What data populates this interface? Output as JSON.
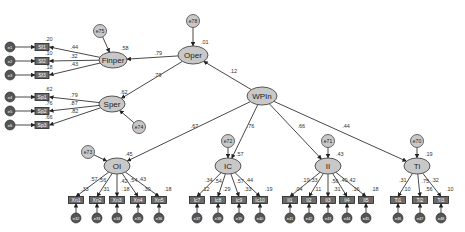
{
  "diagram": {
    "type": "structural-equation-model",
    "latent": [
      {
        "id": "Oper",
        "label": "Oper",
        "x": 193,
        "y": 55,
        "rx": 15,
        "ry": 9,
        "r2": ".01"
      },
      {
        "id": "Finper",
        "label": "Finper",
        "x": 113,
        "y": 60,
        "rx": 14,
        "ry": 8,
        "r2": ".58"
      },
      {
        "id": "Sper",
        "label": "Sper",
        "x": 112,
        "y": 104,
        "rx": 13,
        "ry": 8,
        "r2": ".62"
      },
      {
        "id": "WPIn",
        "label": "WPIn",
        "x": 262,
        "y": 96,
        "rx": 15,
        "ry": 9,
        "r2": ""
      },
      {
        "id": "OI",
        "label": "OI",
        "x": 117,
        "y": 166,
        "rx": 13,
        "ry": 8,
        "r2": ".45"
      },
      {
        "id": "IC",
        "label": "IC",
        "x": 228,
        "y": 166,
        "rx": 13,
        "ry": 8,
        "r2": ".57"
      },
      {
        "id": "II",
        "label": "II",
        "x": 328,
        "y": 166,
        "rx": 13,
        "ry": 8,
        "r2": ".43"
      },
      {
        "id": "Ti",
        "label": "Ti",
        "x": 417,
        "y": 166,
        "rx": 13,
        "ry": 8,
        "r2": ".19"
      }
    ],
    "disturbances": [
      {
        "id": "e78",
        "label": "e78",
        "x": 193,
        "y": 21,
        "target": "Oper"
      },
      {
        "id": "e75",
        "label": "e75",
        "x": 100,
        "y": 31,
        "target": "Finper"
      },
      {
        "id": "e74",
        "label": "e74",
        "x": 139,
        "y": 127,
        "target": "Sper"
      },
      {
        "id": "e73",
        "label": "e73",
        "x": 88,
        "y": 152,
        "target": "OI"
      },
      {
        "id": "e72",
        "label": "e72",
        "x": 228,
        "y": 141,
        "target": "IC"
      },
      {
        "id": "e71",
        "label": "e71",
        "x": 328,
        "y": 141,
        "target": "II"
      },
      {
        "id": "e70",
        "label": "e70",
        "x": 417,
        "y": 141,
        "target": "Ti"
      }
    ],
    "structural_paths": [
      {
        "from": "Oper",
        "to": "Finper",
        "coef": ".79"
      },
      {
        "from": "Oper",
        "to": "Sper",
        "coef": ".79"
      },
      {
        "from": "WPIn",
        "to": "Oper",
        "coef": ".12"
      },
      {
        "from": "WPIn",
        "to": "OI",
        "coef": ".67"
      },
      {
        "from": "WPIn",
        "to": "IC",
        "coef": ".76"
      },
      {
        "from": "WPIn",
        "to": "II",
        "coef": ".66"
      },
      {
        "from": "WPIn",
        "to": "Ti",
        "coef": ".44"
      }
    ],
    "left_indicators": [
      {
        "label": "Sf1",
        "x": 42,
        "y": 47,
        "from": "Finper",
        "loading": ".44",
        "r2": ".20",
        "err": "e1"
      },
      {
        "label": "Sf2",
        "x": 42,
        "y": 61,
        "from": "Finper",
        "loading": ".32",
        "r2": ".10",
        "err": "e2"
      },
      {
        "label": "Sf3",
        "x": 42,
        "y": 75,
        "from": "Finper",
        "loading": ".43",
        "r2": ".18",
        "err": "e3"
      },
      {
        "label": "Sp1",
        "x": 42,
        "y": 97,
        "from": "Sper",
        "loading": ".79",
        "r2": ".62",
        "err": "e4"
      },
      {
        "label": "Sp2",
        "x": 42,
        "y": 111,
        "from": "Sper",
        "loading": ".87",
        "r2": ".76",
        "err": "e5"
      },
      {
        "label": "Sp3",
        "x": 42,
        "y": 125,
        "from": "Sper",
        "loading": ".82",
        "r2": ".66",
        "err": "e6"
      }
    ],
    "bottom_indicators": [
      {
        "label": "Xn1",
        "x": 76,
        "from": "OI",
        "loading": ".57",
        "r2": ".33",
        "err": "e32"
      },
      {
        "label": "Xn2",
        "x": 97,
        "from": "OI",
        "loading": ".56",
        "r2": ".31",
        "err": "e33"
      },
      {
        "label": "Xn3",
        "x": 117,
        "from": "OI",
        "loading": ".42",
        "r2": ".18",
        "err": "e34"
      },
      {
        "label": "Xn4",
        "x": 138,
        "from": "OI",
        "loading": ".54",
        "r2": ".30",
        "err": "e35"
      },
      {
        "label": "Xn5",
        "x": 159,
        "from": "OI",
        "loading": ".43",
        "r2": ".18",
        "err": "e36"
      },
      {
        "label": "Ic7",
        "x": 197,
        "from": "IC",
        "loading": ".34",
        "r2": ".12",
        "err": "e37"
      },
      {
        "label": "Ic8",
        "x": 218,
        "from": "IC",
        "loading": ".54",
        "r2": ".29",
        "err": "e38"
      },
      {
        "label": "Ic9",
        "x": 239,
        "from": "IC",
        "loading": ".57",
        "r2": ".33",
        "err": "e39"
      },
      {
        "label": "Ic10",
        "x": 260,
        "from": "IC",
        "loading": ".44",
        "r2": ".19",
        "err": "e40"
      },
      {
        "label": "Ii1",
        "x": 290,
        "from": "II",
        "loading": ".19",
        "r2": ".04",
        "err": "e41"
      },
      {
        "label": "Ii2",
        "x": 309,
        "from": "II",
        "loading": ".33",
        "r2": ".11",
        "err": "e42"
      },
      {
        "label": "Ii3",
        "x": 328,
        "from": "II",
        "loading": ".56",
        "r2": ".31",
        "err": "e43"
      },
      {
        "label": "Ii4",
        "x": 347,
        "from": "II",
        "loading": ".40",
        "r2": ".16",
        "err": "e44"
      },
      {
        "label": "Ii5",
        "x": 366,
        "from": "II",
        "loading": ".42",
        "r2": ".18",
        "err": "e45"
      },
      {
        "label": "Ti1",
        "x": 398,
        "from": "Ti",
        "loading": ".31",
        "r2": ".10",
        "err": "e46"
      },
      {
        "label": "Ti2",
        "x": 420,
        "from": "Ti",
        "loading": ".75",
        "r2": ".56",
        "err": "e47"
      },
      {
        "label": "Ti3",
        "x": 441,
        "from": "Ti",
        "loading": ".32",
        "r2": ".10",
        "err": "e48"
      }
    ]
  }
}
